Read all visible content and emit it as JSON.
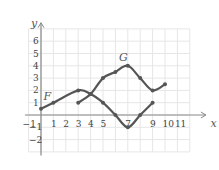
{
  "chart_data": {
    "type": "line",
    "title": "",
    "xlabel": "x",
    "ylabel": "y",
    "xlim": [
      -1,
      12
    ],
    "ylim": [
      -3,
      7
    ],
    "grid": true,
    "x_ticks": [
      "-1",
      "1",
      "2",
      "3",
      "4",
      "5",
      "7",
      "9",
      "10",
      "11"
    ],
    "y_ticks": [
      "6",
      "5",
      "4",
      "3",
      "2",
      "1",
      "-1",
      "-2"
    ],
    "series": [
      {
        "name": "F",
        "x": [
          0,
          1,
          3,
          4,
          5,
          6,
          7,
          8,
          9
        ],
        "y": [
          0.5,
          1,
          2,
          1.7,
          1,
          0,
          -1,
          0,
          1
        ]
      },
      {
        "name": "G",
        "x": [
          3,
          4,
          5,
          6,
          7,
          8,
          9,
          10
        ],
        "y": [
          1,
          1.7,
          3,
          3.5,
          4,
          3,
          2,
          2.5
        ]
      }
    ],
    "annotations": [
      {
        "text": "F",
        "x": 0.2,
        "y": 1.2
      },
      {
        "text": "G",
        "x": 6.3,
        "y": 4.4
      }
    ],
    "colors": {
      "curve": "#555555",
      "grid": "#e6e6e6",
      "axis": "#888888"
    }
  }
}
